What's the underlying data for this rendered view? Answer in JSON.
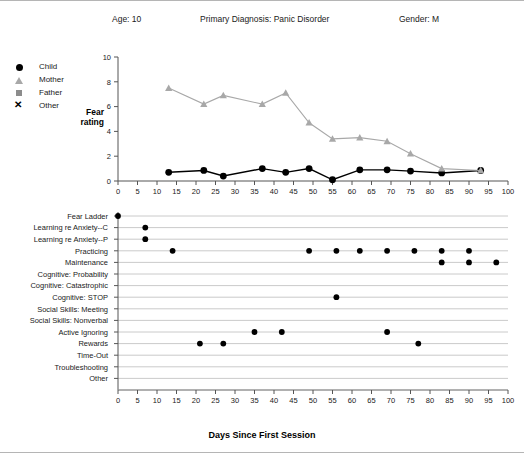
{
  "header": {
    "age": "Age: 10",
    "diagnosis": "Primary Diagnosis:  Panic Disorder",
    "gender": "Gender: M"
  },
  "legend": {
    "items": [
      {
        "label": "Child",
        "marker": "filled-circle-marker",
        "color": "#000000"
      },
      {
        "label": "Mother",
        "marker": "triangle-marker",
        "color": "#a8a8a8"
      },
      {
        "label": "Father",
        "marker": "square-marker",
        "color": "#8c8c8c"
      },
      {
        "label": "Other",
        "marker": "x-marker",
        "color": "#000000"
      }
    ]
  },
  "axis_title": "Days Since First Session",
  "fear_rating_label_line1": "Fear",
  "fear_rating_label_line2": "rating",
  "chart_data": [
    {
      "id": "fear-rating-chart",
      "type": "line",
      "title": "",
      "xlabel": "Days Since First Session",
      "ylabel": "Fear rating",
      "xlim": [
        0,
        100
      ],
      "ylim": [
        0,
        10
      ],
      "xticks": [
        0,
        5,
        10,
        15,
        20,
        25,
        30,
        35,
        40,
        45,
        50,
        55,
        60,
        65,
        70,
        75,
        80,
        85,
        90,
        95,
        100
      ],
      "yticks": [
        0,
        2,
        4,
        6,
        8,
        10
      ],
      "grid": false,
      "legend_position": "outside-left",
      "series": [
        {
          "name": "Child",
          "marker": "filled-circle-marker",
          "color": "#000000",
          "x": [
            13,
            22,
            27,
            37,
            43,
            49,
            55,
            62,
            69,
            75,
            83,
            93
          ],
          "y": [
            0.7,
            0.85,
            0.4,
            1.0,
            0.7,
            1.0,
            0.1,
            0.9,
            0.9,
            0.8,
            0.65,
            0.85
          ]
        },
        {
          "name": "Mother",
          "marker": "triangle-marker",
          "color": "#a8a8a8",
          "x": [
            13,
            22,
            27,
            37,
            43,
            49,
            55,
            62,
            69,
            75,
            83,
            93
          ],
          "y": [
            7.5,
            6.2,
            6.9,
            6.2,
            7.1,
            4.7,
            3.4,
            3.5,
            3.2,
            2.2,
            1.0,
            0.85
          ]
        },
        {
          "name": "Father",
          "marker": "square-marker",
          "color": "#8c8c8c",
          "x": [],
          "y": []
        },
        {
          "name": "Other",
          "marker": "x-marker",
          "color": "#000000",
          "x": [],
          "y": []
        }
      ]
    },
    {
      "id": "session-content-chart",
      "type": "scatter",
      "title": "",
      "xlabel": "Days Since First Session",
      "ylabel": "",
      "xlim": [
        0,
        100
      ],
      "xticks": [
        0,
        5,
        10,
        15,
        20,
        25,
        30,
        35,
        40,
        45,
        50,
        55,
        60,
        65,
        70,
        75,
        80,
        85,
        90,
        95,
        100
      ],
      "grid": true,
      "marker": "filled-circle-marker",
      "color": "#000000",
      "categories": [
        "Fear Ladder",
        "Learning re Anxiety--C",
        "Learning re Anxiety--P",
        "Practicing",
        "Maintenance",
        "Cognitive: Probability",
        "Cognitive: Catastrophic",
        "Cognitive: STOP",
        "Social Skills: Meeting",
        "Social Skills: Nonverbal",
        "Active Ignoring",
        "Rewards",
        "Time-Out",
        "Troubleshooting",
        "Other"
      ],
      "points": [
        {
          "category": "Fear Ladder",
          "x": [
            0
          ]
        },
        {
          "category": "Learning re Anxiety--C",
          "x": [
            7
          ]
        },
        {
          "category": "Learning re Anxiety--P",
          "x": [
            7
          ]
        },
        {
          "category": "Practicing",
          "x": [
            14,
            49,
            56,
            62,
            69,
            76,
            83,
            90
          ]
        },
        {
          "category": "Maintenance",
          "x": [
            83,
            90,
            97
          ]
        },
        {
          "category": "Cognitive: Probability",
          "x": []
        },
        {
          "category": "Cognitive: Catastrophic",
          "x": []
        },
        {
          "category": "Cognitive: STOP",
          "x": [
            56
          ]
        },
        {
          "category": "Social Skills: Meeting",
          "x": []
        },
        {
          "category": "Social Skills: Nonverbal",
          "x": []
        },
        {
          "category": "Active Ignoring",
          "x": [
            35,
            42,
            69
          ]
        },
        {
          "category": "Rewards",
          "x": [
            21,
            27,
            77
          ]
        },
        {
          "category": "Time-Out",
          "x": []
        },
        {
          "category": "Troubleshooting",
          "x": []
        },
        {
          "category": "Other",
          "x": []
        }
      ]
    }
  ]
}
